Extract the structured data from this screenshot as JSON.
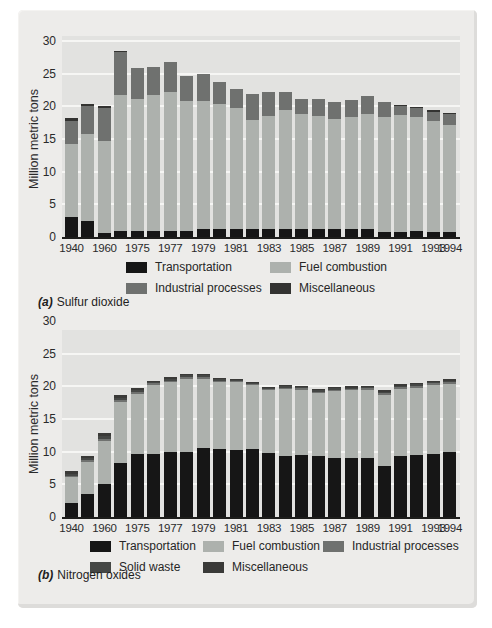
{
  "figure": {
    "caption_a_label": "(a)",
    "caption_a_text": "Sulfur dioxide",
    "caption_b_label": "(b)",
    "caption_b_text": "Nitrogen oxides"
  },
  "chart_data": [
    {
      "id": "a",
      "type": "bar",
      "stacked": true,
      "caption_label": "(a)",
      "caption_text": "Sulfur dioxide",
      "ylabel": "Million metric tons",
      "ylim": [
        0,
        30
      ],
      "yticks": [
        30,
        25,
        20,
        15,
        10,
        5,
        0
      ],
      "grid": "horizontal-white",
      "legend_position": "below",
      "years": [
        1940,
        1950,
        1960,
        1970,
        1975,
        1976,
        1977,
        1978,
        1979,
        1980,
        1981,
        1982,
        1983,
        1984,
        1985,
        1986,
        1987,
        1988,
        1989,
        1990,
        1991,
        1992,
        1993,
        1994
      ],
      "xtick_labels": [
        {
          "label": "1940",
          "bar": 0
        },
        {
          "label": "1960",
          "bar": 2
        },
        {
          "label": "1975",
          "bar": 4
        },
        {
          "label": "1977",
          "bar": 6
        },
        {
          "label": "1979",
          "bar": 8
        },
        {
          "label": "1981",
          "bar": 10
        },
        {
          "label": "1983",
          "bar": 12
        },
        {
          "label": "1985",
          "bar": 14
        },
        {
          "label": "1987",
          "bar": 16
        },
        {
          "label": "1989",
          "bar": 18
        },
        {
          "label": "1991",
          "bar": 20
        },
        {
          "label": "1993",
          "bar": 22
        },
        {
          "label": "1994",
          "bar": 23
        }
      ],
      "series": [
        {
          "name": "Transportation",
          "color": "#161616",
          "values": [
            3.0,
            2.4,
            0.6,
            0.9,
            1.0,
            1.0,
            1.0,
            1.0,
            1.2,
            1.2,
            1.2,
            1.2,
            1.2,
            1.2,
            1.2,
            1.3,
            1.3,
            1.3,
            1.2,
            0.8,
            0.8,
            0.9,
            0.8,
            0.7
          ]
        },
        {
          "name": "Fuel combustion",
          "color": "#adb1ad",
          "values": [
            11.3,
            13.4,
            14.1,
            20.9,
            20.2,
            20.7,
            21.2,
            19.9,
            19.7,
            19.1,
            18.5,
            16.7,
            17.3,
            18.2,
            17.6,
            17.3,
            16.7,
            17.1,
            17.6,
            17.6,
            17.9,
            17.5,
            16.9,
            16.4
          ]
        },
        {
          "name": "Industrial processes",
          "color": "#6f716f",
          "values": [
            3.5,
            4.2,
            5.1,
            6.6,
            4.7,
            4.4,
            4.6,
            3.7,
            4.0,
            3.4,
            3.0,
            4.0,
            3.7,
            2.8,
            2.4,
            2.6,
            2.6,
            2.6,
            2.8,
            2.2,
            1.3,
            1.3,
            1.5,
            1.7
          ]
        },
        {
          "name": "Miscellaneous",
          "color": "#333331",
          "values": [
            0.4,
            0.4,
            0.3,
            0.1,
            0,
            0,
            0,
            0,
            0,
            0,
            0,
            0,
            0,
            0,
            0,
            0,
            0,
            0,
            0,
            0,
            0.2,
            0.2,
            0.2,
            0.2
          ]
        }
      ]
    },
    {
      "id": "b",
      "type": "bar",
      "stacked": true,
      "caption_label": "(b)",
      "caption_text": "Nitrogen oxides",
      "ylabel": "Million metric tons",
      "ylim": [
        0,
        30
      ],
      "yticks": [
        30,
        25,
        20,
        15,
        10,
        5,
        0
      ],
      "grid": "horizontal-white",
      "legend_position": "below",
      "years": [
        1940,
        1950,
        1960,
        1970,
        1975,
        1976,
        1977,
        1978,
        1979,
        1980,
        1981,
        1982,
        1983,
        1984,
        1985,
        1986,
        1987,
        1988,
        1989,
        1990,
        1991,
        1992,
        1993,
        1994
      ],
      "xtick_labels": [
        {
          "label": "1940",
          "bar": 0
        },
        {
          "label": "1960",
          "bar": 2
        },
        {
          "label": "1975",
          "bar": 4
        },
        {
          "label": "1977",
          "bar": 6
        },
        {
          "label": "1979",
          "bar": 8
        },
        {
          "label": "1981",
          "bar": 10
        },
        {
          "label": "1983",
          "bar": 12
        },
        {
          "label": "1985",
          "bar": 14
        },
        {
          "label": "1987",
          "bar": 16
        },
        {
          "label": "1989",
          "bar": 18
        },
        {
          "label": "1991",
          "bar": 20
        },
        {
          "label": "1993",
          "bar": 22
        },
        {
          "label": "1994",
          "bar": 23
        }
      ],
      "series": [
        {
          "name": "Transportation",
          "color": "#161616",
          "values": [
            2.2,
            3.6,
            5.0,
            8.2,
            9.6,
            9.6,
            9.9,
            10.0,
            10.6,
            10.4,
            10.3,
            10.4,
            9.8,
            9.4,
            9.5,
            9.3,
            9.0,
            9.0,
            9.0,
            7.8,
            9.4,
            9.5,
            9.6,
            9.9
          ]
        },
        {
          "name": "Fuel combustion",
          "color": "#adb1ad",
          "values": [
            3.9,
            4.8,
            6.7,
            9.4,
            9.3,
            10.6,
            10.7,
            11.2,
            10.6,
            10.3,
            10.3,
            9.8,
            9.6,
            10.2,
            10.0,
            9.7,
            10.3,
            10.4,
            10.5,
            10.9,
            10.2,
            10.3,
            10.6,
            10.5
          ]
        },
        {
          "name": "Industrial processes",
          "color": "#6f716f",
          "values": [
            0.2,
            0.3,
            0.3,
            0.3,
            0.3,
            0.3,
            0.3,
            0.3,
            0.3,
            0.2,
            0.2,
            0.2,
            0.2,
            0.2,
            0.2,
            0.2,
            0.2,
            0.2,
            0.2,
            0.3,
            0.3,
            0.3,
            0.3,
            0.3
          ]
        },
        {
          "name": "Solid waste",
          "color": "#454745",
          "values": [
            0.3,
            0.3,
            0.4,
            0.3,
            0.2,
            0.2,
            0.2,
            0.2,
            0.2,
            0.2,
            0.2,
            0.2,
            0.2,
            0.2,
            0.2,
            0.2,
            0.2,
            0.2,
            0.2,
            0.2,
            0.2,
            0.2,
            0.2,
            0.2
          ]
        },
        {
          "name": "Miscellaneous",
          "color": "#3a3a38",
          "values": [
            0.4,
            0.4,
            0.5,
            0.5,
            0.3,
            0.2,
            0.3,
            0.2,
            0.2,
            0.2,
            0.2,
            0.1,
            0.1,
            0.2,
            0.2,
            0.2,
            0.2,
            0.2,
            0.2,
            0.2,
            0.2,
            0.2,
            0.2,
            0.2
          ]
        }
      ]
    }
  ]
}
